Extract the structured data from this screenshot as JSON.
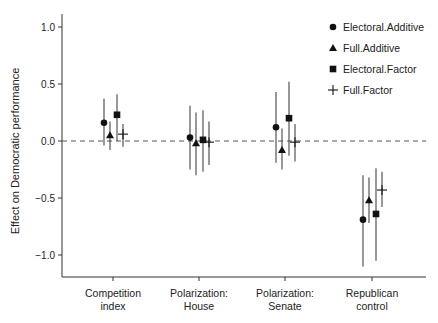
{
  "chart_data": {
    "type": "scatter",
    "subtype": "dot-and-whisker",
    "title": "",
    "xlabel": "",
    "ylabel": "Effect on Democratic performance",
    "ylim": [
      -1.2,
      1.1
    ],
    "yticks": [
      1.0,
      0.5,
      0.0,
      -0.5,
      -1.0
    ],
    "ytick_labels": [
      "1.0",
      "0.5",
      "0.0",
      "−0.5",
      "−1.0"
    ],
    "categories": [
      "Competition index",
      "Polarization: House",
      "Polarization: Senate",
      "Republican control"
    ],
    "category_labels": [
      [
        "Competition",
        "index"
      ],
      [
        "Polarization:",
        "House"
      ],
      [
        "Polarization:",
        "Senate"
      ],
      [
        "Republican",
        "control"
      ]
    ],
    "reference_line": {
      "y": 0.0,
      "style": "dashed"
    },
    "grid": false,
    "legend_position": "top-right",
    "series": [
      {
        "name": "Electoral.Additive",
        "marker": "circle",
        "values": [
          0.16,
          0.03,
          0.12,
          -0.69
        ],
        "lower": [
          -0.04,
          -0.25,
          -0.19,
          -1.1
        ],
        "upper": [
          0.37,
          0.31,
          0.43,
          -0.3
        ]
      },
      {
        "name": "Full.Additive",
        "marker": "triangle",
        "values": [
          0.05,
          -0.02,
          -0.08,
          -0.52
        ],
        "lower": [
          -0.08,
          -0.3,
          -0.25,
          -0.72
        ],
        "upper": [
          0.17,
          0.25,
          0.11,
          -0.32
        ]
      },
      {
        "name": "Electoral.Factor",
        "marker": "square",
        "values": [
          0.23,
          0.01,
          0.2,
          -0.64
        ],
        "lower": [
          0.0,
          -0.27,
          -0.13,
          -1.05
        ],
        "upper": [
          0.41,
          0.27,
          0.52,
          -0.24
        ]
      },
      {
        "name": "Full.Factor",
        "marker": "plus",
        "values": [
          0.06,
          -0.01,
          -0.01,
          -0.43
        ],
        "lower": [
          -0.05,
          -0.21,
          -0.18,
          -0.58
        ],
        "upper": [
          0.15,
          0.17,
          0.15,
          -0.27
        ]
      }
    ]
  },
  "colors": {
    "marker": "#111111",
    "whisker": "#444444",
    "axis": "#333333",
    "reference": "#555555"
  }
}
